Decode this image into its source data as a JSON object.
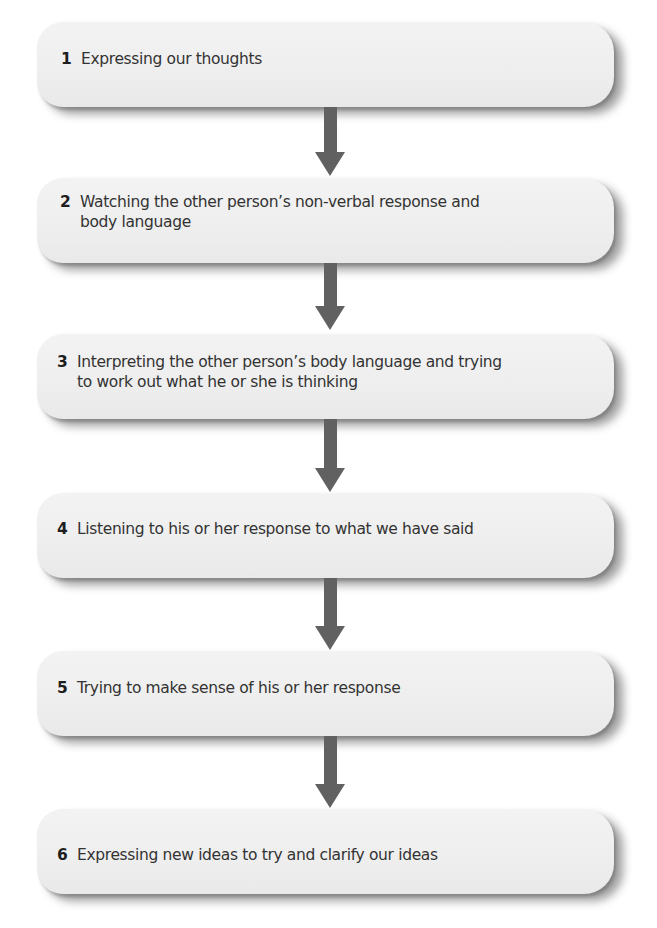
{
  "diagram": {
    "type": "vertical-flowchart",
    "colors": {
      "background": "#ffffff",
      "box_fill": "#efefef",
      "arrow": "#616161",
      "text": "#333333",
      "number": "#1e1e1e"
    },
    "steps": [
      {
        "number": "1",
        "text": "Expressing our thoughts"
      },
      {
        "number": "2",
        "text": "Watching the other person’s non-verbal response and\nbody language"
      },
      {
        "number": "3",
        "text": "Interpreting the other person’s body language and trying\nto work out what he or she is thinking"
      },
      {
        "number": "4",
        "text": "Listening to his or her response to what we have said"
      },
      {
        "number": "5",
        "text": "Trying to make sense of his or her response"
      },
      {
        "number": "6",
        "text": "Expressing new ideas to try and clarify our ideas"
      }
    ],
    "arrows": [
      {
        "from": "1",
        "to": "2",
        "icon": "arrow-down-icon"
      },
      {
        "from": "2",
        "to": "3",
        "icon": "arrow-down-icon"
      },
      {
        "from": "3",
        "to": "4",
        "icon": "arrow-down-icon"
      },
      {
        "from": "4",
        "to": "5",
        "icon": "arrow-down-icon"
      },
      {
        "from": "5",
        "to": "6",
        "icon": "arrow-down-icon"
      }
    ]
  }
}
